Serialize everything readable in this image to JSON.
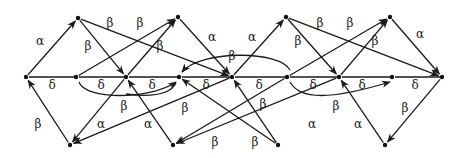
{
  "diagram": {
    "type": "directed-graph",
    "background": "#ffffff",
    "ink": "#1a1a1a",
    "labels": {
      "alpha": "α",
      "beta": "β",
      "delta": "δ"
    },
    "nodes": [
      {
        "id": "M0",
        "x": 26,
        "y": 77
      },
      {
        "id": "M1",
        "x": 76,
        "y": 77
      },
      {
        "id": "M2",
        "x": 126,
        "y": 77
      },
      {
        "id": "M3",
        "x": 179,
        "y": 77
      },
      {
        "id": "M4",
        "x": 232,
        "y": 77
      },
      {
        "id": "M5",
        "x": 287,
        "y": 77
      },
      {
        "id": "M6",
        "x": 339,
        "y": 77
      },
      {
        "id": "M7",
        "x": 392,
        "y": 77
      },
      {
        "id": "M8",
        "x": 442,
        "y": 77
      },
      {
        "id": "T0",
        "x": 78,
        "y": 18
      },
      {
        "id": "T1",
        "x": 178,
        "y": 17
      },
      {
        "id": "T2",
        "x": 286,
        "y": 17
      },
      {
        "id": "T3",
        "x": 390,
        "y": 17
      },
      {
        "id": "B0",
        "x": 70,
        "y": 145
      },
      {
        "id": "B1",
        "x": 173,
        "y": 145
      },
      {
        "id": "B2",
        "x": 278,
        "y": 145
      },
      {
        "id": "B3",
        "x": 385,
        "y": 145
      }
    ],
    "edges": [
      {
        "from": "M0",
        "to": "T0",
        "label": "α",
        "lx": 40,
        "ly": 45,
        "arrow": true
      },
      {
        "from": "B0",
        "to": "M0",
        "label": "β",
        "lx": 38,
        "ly": 128,
        "arrow": true
      },
      {
        "from": "M0",
        "to": "M1",
        "label": "δ",
        "lx": 52,
        "ly": 89,
        "arrow": false
      },
      {
        "from": "M1",
        "to": "M2",
        "label": "δ",
        "lx": 101,
        "ly": 89,
        "arrow": false
      },
      {
        "from": "M2",
        "to": "M3",
        "label": "δ",
        "lx": 152,
        "ly": 89,
        "arrow": false
      },
      {
        "from": "M3",
        "to": "M4",
        "label": "δ",
        "lx": 206,
        "ly": 89,
        "arrow": false
      },
      {
        "from": "M4",
        "to": "M5",
        "label": "δ",
        "lx": 259,
        "ly": 89,
        "arrow": false
      },
      {
        "from": "M5",
        "to": "M6",
        "label": "δ",
        "lx": 313,
        "ly": 89,
        "arrow": false
      },
      {
        "from": "M6",
        "to": "M7",
        "label": "δ",
        "lx": 362,
        "ly": 89,
        "arrow": false
      },
      {
        "from": "M7",
        "to": "M8",
        "label": "δ",
        "lx": 415,
        "ly": 89,
        "arrow": false
      },
      {
        "from": "T0",
        "to": "M2",
        "label": "β",
        "lx": 88,
        "ly": 50,
        "arrow": true
      },
      {
        "from": "T0",
        "to": "M4",
        "label": "β",
        "lx": 110,
        "ly": 27,
        "arrow": true
      },
      {
        "from": "M1",
        "to": "T1",
        "label": "β",
        "lx": 140,
        "ly": 27,
        "arrow": true
      },
      {
        "from": "M2",
        "to": "T1",
        "label": "β",
        "lx": 160,
        "ly": 50,
        "arrow": true
      },
      {
        "from": "T1",
        "to": "M4",
        "label": "α",
        "lx": 212,
        "ly": 41,
        "arrow": true
      },
      {
        "from": "M4",
        "to": "T2",
        "label": "α",
        "lx": 252,
        "ly": 41,
        "arrow": true
      },
      {
        "from": "T2",
        "to": "M6",
        "label": "β",
        "lx": 298,
        "ly": 45,
        "arrow": true
      },
      {
        "from": "T2",
        "to": "M8",
        "label": "β",
        "lx": 320,
        "ly": 27,
        "arrow": true
      },
      {
        "from": "M5",
        "to": "T3",
        "label": "β",
        "lx": 350,
        "ly": 27,
        "arrow": true
      },
      {
        "from": "M6",
        "to": "T3",
        "label": "β",
        "lx": 375,
        "ly": 45,
        "arrow": true
      },
      {
        "from": "T3",
        "to": "M8",
        "label": "α",
        "lx": 420,
        "ly": 38,
        "arrow": true
      },
      {
        "from": "M8",
        "to": "B3",
        "label": "β",
        "lx": 405,
        "ly": 112,
        "arrow": true
      },
      {
        "from": "B3",
        "to": "M6",
        "label": "α",
        "lx": 358,
        "ly": 128,
        "arrow": true
      },
      {
        "from": "M6",
        "to": "B1",
        "label": "α",
        "lx": 312,
        "ly": 128,
        "arrow": true
      },
      {
        "from": "B2",
        "to": "M4",
        "label": "β",
        "lx": 263,
        "ly": 108,
        "arrow": true
      },
      {
        "from": "B2",
        "to": "M3",
        "label": "β",
        "lx": 255,
        "ly": 146,
        "arrow": true
      },
      {
        "from": "M5",
        "to": "B1",
        "label": "β",
        "lx": 215,
        "ly": 146,
        "arrow": true
      },
      {
        "from": "M4",
        "to": "B0",
        "label": "β",
        "lx": 185,
        "ly": 112,
        "arrow": true
      },
      {
        "from": "B1",
        "to": "M2",
        "label": "α",
        "lx": 148,
        "ly": 128,
        "arrow": true
      },
      {
        "from": "M2",
        "to": "B0",
        "label": "α",
        "lx": 101,
        "ly": 128,
        "arrow": true
      }
    ],
    "curved_edges": [
      {
        "path": "M 79 82 C 85 100, 150 100, 176 82",
        "label": "β",
        "lx": 124,
        "ly": 110,
        "arrow": true
      },
      {
        "path": "M 290 70 C 280 50, 200 50, 182 72",
        "label": "β",
        "lx": 232,
        "ly": 60,
        "arrow": true
      },
      {
        "path": "M 176 83 C 170 95, 150 97, 126 94",
        "label": "",
        "lx": 0,
        "ly": 0,
        "arrow": false
      },
      {
        "path": "M 290 82 C 300 100, 330 100, 390 82",
        "label": "β",
        "lx": 336,
        "ly": 110,
        "arrow": true
      }
    ]
  }
}
